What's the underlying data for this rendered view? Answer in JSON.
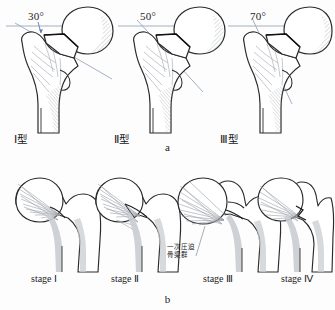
{
  "figure": {
    "background_color": "#fdfdfd",
    "ink_color": "#1c1c1c",
    "bone_fill": "#ffffff",
    "shade_color": "#c9cdd2",
    "guide_line_color": "#9aa7bd"
  },
  "panels": [
    {
      "id": "a",
      "letter": "a",
      "caption_type": "panel-letter",
      "items": [
        {
          "angle_label": "30°",
          "type_label": "Ⅰ型",
          "angle_value": 30
        },
        {
          "angle_label": "50°",
          "type_label": "Ⅱ型",
          "angle_value": 50
        },
        {
          "angle_label": "70°",
          "type_label": "Ⅲ型",
          "angle_value": 70
        }
      ]
    },
    {
      "id": "b",
      "letter": "b",
      "caption_type": "panel-letter",
      "items": [
        {
          "stage_label": "stage Ⅰ"
        },
        {
          "stage_label": "stage Ⅱ"
        },
        {
          "stage_label": "stage Ⅲ"
        },
        {
          "stage_label": "stage Ⅳ"
        }
      ],
      "annotations": [
        {
          "line1": "一次圧迫",
          "line2": "骨梁群"
        }
      ]
    }
  ]
}
